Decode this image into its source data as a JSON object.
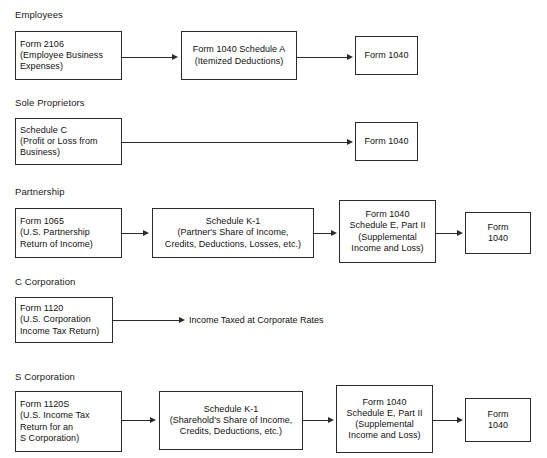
{
  "diagram": {
    "sections": [
      {
        "label": "Employees",
        "nodes": [
          {
            "lines": [
              "Form 2106",
              "(Employee Business",
              "Expenses)"
            ]
          },
          {
            "lines": [
              "Form 1040 Schedule A",
              "(Itemized Deductions)"
            ]
          },
          {
            "lines": [
              "Form 1040"
            ]
          }
        ]
      },
      {
        "label": "Sole Proprietors",
        "nodes": [
          {
            "lines": [
              "Schedule C",
              "(Profit or Loss from",
              "Business)"
            ]
          },
          {
            "lines": [
              "Form 1040"
            ]
          }
        ]
      },
      {
        "label": "Partnership",
        "nodes": [
          {
            "lines": [
              "Form 1065",
              "(U.S. Partnership",
              "Return of Income)"
            ]
          },
          {
            "lines": [
              "Schedule K-1",
              "(Partner's Share of Income,",
              "Credits, Deductions, Losses, etc.)"
            ]
          },
          {
            "lines": [
              "Form 1040",
              "Schedule E, Part II",
              "(Supplemental",
              "Income and Loss)"
            ]
          },
          {
            "lines": [
              "Form",
              "1040"
            ]
          }
        ]
      },
      {
        "label": "C Corporation",
        "nodes": [
          {
            "lines": [
              "Form 1120",
              "(U.S. Corporation",
              "Income Tax Return)"
            ]
          }
        ],
        "terminal_text": "Income Taxed at Corporate Rates"
      },
      {
        "label": "S Corporation",
        "nodes": [
          {
            "lines": [
              "Form 1120S",
              "(U.S. Income Tax",
              "Return for an",
              "S Corporation)"
            ]
          },
          {
            "lines": [
              "Schedule K-1",
              "(Sharehold's Share of Income,",
              "Credits, Deductions, etc.)"
            ]
          },
          {
            "lines": [
              "Form 1040",
              "Schedule E, Part II",
              "(Supplemental",
              "Income and Loss)"
            ]
          },
          {
            "lines": [
              "Form",
              "1040"
            ]
          }
        ]
      }
    ],
    "colors": {
      "box_border": "#2b2b2b",
      "connector": "#2b2b2b",
      "text": "#111111",
      "background": "#ffffff"
    }
  }
}
